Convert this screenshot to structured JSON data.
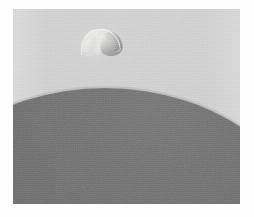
{
  "image": {
    "kind": "natural-photograph",
    "subject": "bright half-lit crescent body above the dark limb of a larger body",
    "orientation": "landscape",
    "width_px": 254,
    "height_px": 217,
    "caption": "",
    "alt_text": "Grainy monochrome photograph: a small brightly lit half-disc object in a pale gray sky above the smooth dark curved limb of a much larger body filling the lower right."
  },
  "border": {
    "name": "white paper margin",
    "color": "#fefefe",
    "left_px": 13,
    "top_px": 9,
    "right_px": 14,
    "bottom_px": 13
  },
  "plate": {
    "name": "photographic plate",
    "left_px": 13,
    "top_px": 9,
    "width_px": 227,
    "height_px": 195
  },
  "regions": {
    "sky": {
      "label": "background sky field",
      "color": "#cfd0cf",
      "color_light": "#d1d2d1",
      "color_dark": "#cbcccb",
      "tone": "light gray"
    },
    "dark_body": {
      "label": "dark curved limb of large body",
      "color": "#6b6b6b",
      "color_light": "#747474",
      "color_dark": "#656565",
      "tone": "medium dark gray",
      "shape": "large ellipse, upper-left limb visible",
      "limb_apex_x_px": 198,
      "limb_apex_y_px": 88,
      "limb_left_edge_y_px": 163,
      "limb_right_edge_y_px": 96
    },
    "moonlet": {
      "label": "bright half-disc object",
      "color_lit": "#ececeb",
      "color_rim": "#fbfbfa",
      "color_shadow": "#8a8a88",
      "tone": "near white",
      "shape": "half disc / D-shape with flat lower edge",
      "center_x_px": 100,
      "center_y_px": 36,
      "width_px": 40,
      "height_px": 26,
      "rotation_deg": -6,
      "illumination": "lit from upper left, terminator shading on lower right"
    }
  },
  "texture": {
    "label": "film grain",
    "grain_opacity": 0.3,
    "style": "fine analog emulsion noise"
  }
}
